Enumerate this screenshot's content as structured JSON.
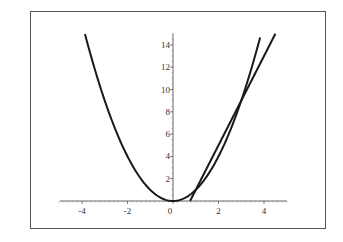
{
  "chart_data": {
    "type": "line",
    "title": "",
    "xlabel": "",
    "ylabel": "",
    "xlim": [
      -5,
      5
    ],
    "ylim": [
      0,
      15
    ],
    "grid": false,
    "legend": null,
    "x_ticks": [
      "-4",
      "-2",
      "0",
      "2",
      "4"
    ],
    "y_ticks": [
      "2",
      "4",
      "6",
      "8",
      "10",
      "12",
      "14"
    ],
    "series": [
      {
        "name": "parabola y = x^2",
        "x": [
          -3.87,
          -3,
          -2,
          -1,
          0,
          1,
          2,
          3,
          3.87
        ],
        "values": [
          15,
          9,
          4,
          1,
          0,
          1,
          4,
          9,
          15
        ]
      },
      {
        "name": "secant line y = 4x - 3",
        "x": [
          0.75,
          1,
          3,
          4.5
        ],
        "values": [
          0,
          1,
          9,
          15
        ]
      }
    ],
    "intersections": [
      [
        1,
        1
      ],
      [
        3,
        9
      ]
    ]
  }
}
